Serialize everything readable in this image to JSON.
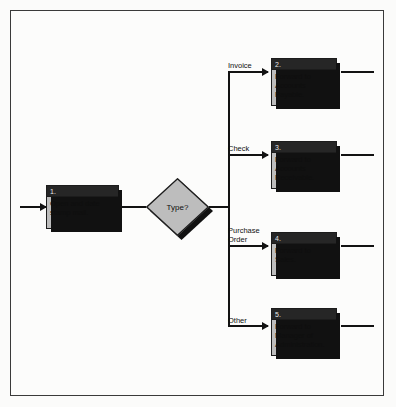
{
  "diagram": {
    "background_color": "#fbfbfa",
    "frame_color": "#3a3a3a",
    "box_fill_color": "#bdbdbd",
    "box_header_color": "#262626",
    "line_color": "#121212",
    "shadow_color": "#111111"
  },
  "start_connector": {
    "name": "inbound-arrow"
  },
  "nodes": [
    {
      "id": "1",
      "number": "1.",
      "text": "Open and date\nstamp mail.",
      "shape": "process"
    },
    {
      "id": "decision",
      "number": "",
      "text": "Type?",
      "shape": "decision"
    },
    {
      "id": "2",
      "number": "2.",
      "text": "Forward to\nAccounts\nPayable.",
      "shape": "process"
    },
    {
      "id": "3",
      "number": "3.",
      "text": "Forward to\nAccounts\nReceivable.",
      "shape": "process"
    },
    {
      "id": "4",
      "number": "4.",
      "text": "Forward to\nSales.",
      "shape": "process"
    },
    {
      "id": "5",
      "number": "5.",
      "text": "Forward to\nManager of\nAdministration.",
      "shape": "process"
    }
  ],
  "branches": [
    {
      "label": "Invoice",
      "target": "2"
    },
    {
      "label": "Check",
      "target": "3"
    },
    {
      "label": "Purchase\nOrder",
      "target": "4"
    },
    {
      "label": "Other",
      "target": "5"
    }
  ]
}
